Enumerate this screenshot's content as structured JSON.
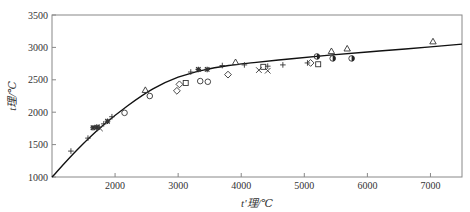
{
  "chart_data": {
    "type": "scatter",
    "title": "",
    "xlabel": "t'理/℃",
    "ylabel": "t理/℃",
    "xlim": [
      1000,
      7500
    ],
    "ylim": [
      1000,
      3500
    ],
    "xticks": [
      2000,
      3000,
      4000,
      5000,
      6000,
      7000
    ],
    "yticks": [
      1000,
      1500,
      2000,
      2500,
      3000,
      3500
    ],
    "grid": false,
    "legend": null,
    "curve": {
      "name": "fit",
      "x": [
        1000,
        1400,
        1800,
        2200,
        2600,
        3000,
        3400,
        3800,
        4200,
        4800,
        5400,
        6000,
        6600,
        7500
      ],
      "y": [
        1000,
        1420,
        1790,
        2100,
        2360,
        2540,
        2650,
        2720,
        2765,
        2825,
        2880,
        2930,
        2975,
        3050
      ]
    },
    "series": [
      {
        "name": "plus",
        "marker": "+",
        "x": [
          1300,
          1570,
          1750,
          1820,
          1950,
          3200,
          3700,
          4050,
          4420,
          4660,
          5050
        ],
        "y": [
          1400,
          1600,
          1770,
          1820,
          1930,
          2620,
          2720,
          2730,
          2710,
          2730,
          2760
        ]
      },
      {
        "name": "asterisk",
        "marker": "*",
        "x": [
          1650,
          1710,
          1880,
          3320,
          3460
        ],
        "y": [
          1760,
          1770,
          1860,
          2660,
          2660
        ]
      },
      {
        "name": "cross",
        "marker": "x",
        "x": [
          1760,
          4280,
          4420
        ],
        "y": [
          1750,
          2650,
          2640
        ]
      },
      {
        "name": "circle",
        "marker": "o",
        "x": [
          2150,
          2550,
          3350,
          3470
        ],
        "y": [
          1990,
          2250,
          2480,
          2470
        ]
      },
      {
        "name": "diamond",
        "marker": "◇",
        "x": [
          2980,
          3020,
          3790,
          5100
        ],
        "y": [
          2330,
          2430,
          2580,
          2760
        ]
      },
      {
        "name": "square",
        "marker": "□",
        "x": [
          3120,
          4350,
          5220
        ],
        "y": [
          2450,
          2700,
          2740
        ]
      },
      {
        "name": "triangle",
        "marker": "△",
        "x": [
          2480,
          3910,
          5430,
          5680,
          7040
        ],
        "y": [
          2340,
          2770,
          2940,
          2980,
          3090
        ]
      },
      {
        "name": "half-filled-circle",
        "marker": "◐",
        "x": [
          5200,
          5450,
          5750
        ],
        "y": [
          2860,
          2830,
          2830
        ]
      }
    ]
  }
}
